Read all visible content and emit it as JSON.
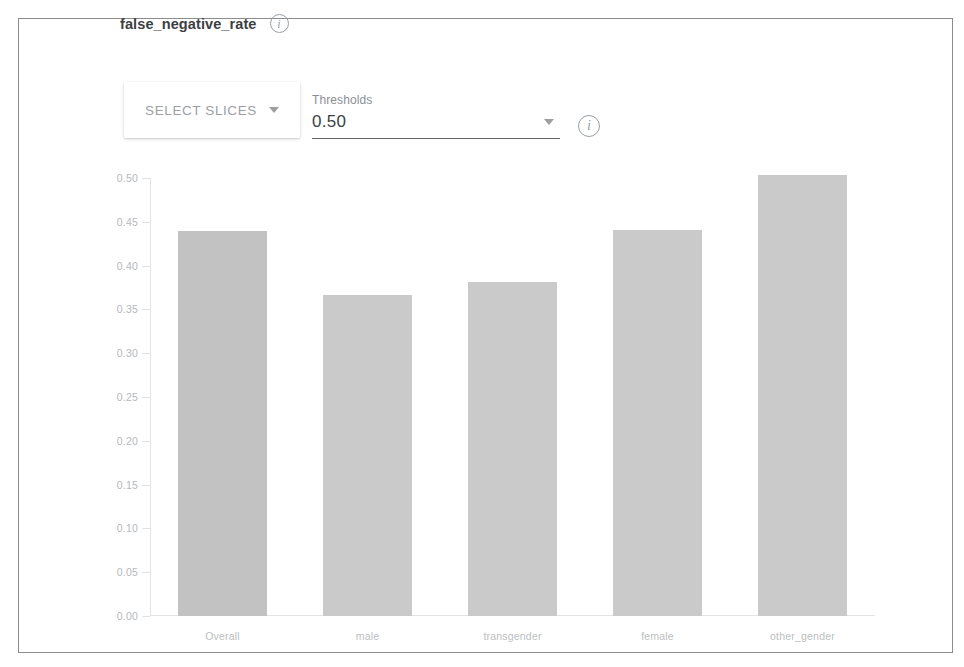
{
  "panel": {
    "title": "false_negative_rate",
    "title_info_icon": "info-icon",
    "border_color": "#8c8c8c"
  },
  "controls": {
    "select_slices": {
      "label": "SELECT SLICES",
      "caret_icon": "chevron-down-icon"
    },
    "thresholds": {
      "label": "Thresholds",
      "value": "0.50",
      "caret_icon": "chevron-down-icon",
      "options": [
        "0.50"
      ]
    },
    "info_icon": "info-icon"
  },
  "chart_data": {
    "type": "bar",
    "title": "false_negative_rate",
    "xlabel": "",
    "ylabel": "",
    "categories": [
      "Overall",
      "male",
      "transgender",
      "female",
      "other_gender"
    ],
    "values": [
      0.44,
      0.366,
      0.381,
      0.441,
      0.504
    ],
    "ylim": [
      0.0,
      0.5
    ],
    "ytick_labels": [
      "0.50",
      "0.45",
      "0.40",
      "0.35",
      "0.30",
      "0.25",
      "0.20",
      "0.15",
      "0.10",
      "0.05",
      "0.00"
    ],
    "ytick_values": [
      0.5,
      0.45,
      0.4,
      0.35,
      0.3,
      0.25,
      0.2,
      0.15,
      0.1,
      0.05,
      0.0
    ],
    "grid": false,
    "legend": null,
    "bar_color": "#cacaca",
    "bar_color_first": "#c2c2c2"
  }
}
